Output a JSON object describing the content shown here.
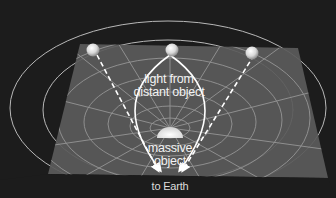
{
  "diagram": {
    "labels": {
      "light_line1": "light from",
      "light_line2": "distant object",
      "mass_line1": "massive",
      "mass_line2": "object",
      "earth": "to Earth"
    },
    "elements": {
      "distant_images": 3,
      "grid": "curved spacetime plane",
      "arrows": "light paths converging toward Earth"
    },
    "colors": {
      "background": "#1c1c1c",
      "plane": "#5a5a5a",
      "grid_lines": "#9a9a9a",
      "light_paths": "#ffffff",
      "orbits": "#b0b0b0"
    }
  }
}
